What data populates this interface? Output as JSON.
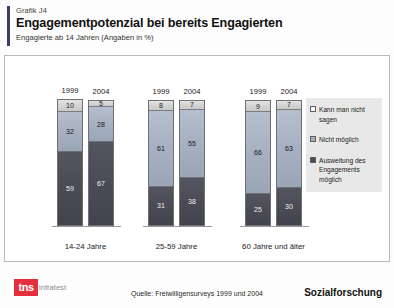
{
  "header": {
    "kicker": "Grafik J4",
    "title": "Engagementpotenzial bei bereits Engagierten",
    "subtitle": "Engagierte ab 14 Jahren (Angaben in %)"
  },
  "legend": {
    "items": [
      {
        "label": "Kann man nicht sagen",
        "swatch": "legend-swatch-white"
      },
      {
        "label": "Nicht möglich",
        "swatch": "legend-swatch-blue-gray"
      },
      {
        "label": "Ausweitung des Engagements möglich",
        "swatch": "legend-swatch-dark"
      }
    ]
  },
  "footer": {
    "logo_mark": "tns",
    "logo_word": "infratest",
    "source": "Quelle: Freiwilligensurveys 1999 und 2004",
    "tagline": "Sozialforschung"
  },
  "chart_data": {
    "type": "bar",
    "title": "Engagementpotenzial bei bereits Engagierten",
    "subtitle": "Engagierte ab 14 Jahren (Angaben in %)",
    "xlabel": "",
    "ylabel": "",
    "ylim": [
      0,
      100
    ],
    "grid": false,
    "stacked": true,
    "legend_position": "right",
    "categories": [
      "14-24 Jahre",
      "25-59 Jahre",
      "60 Jahre und älter"
    ],
    "subcategories": [
      "1999",
      "2004"
    ],
    "series": [
      {
        "name": "Kann man nicht sagen",
        "color": "#d2d2d2",
        "values": [
          [
            10,
            5
          ],
          [
            8,
            7
          ],
          [
            9,
            7
          ]
        ]
      },
      {
        "name": "Nicht möglich",
        "color": "#a6b0c0",
        "values": [
          [
            32,
            28
          ],
          [
            61,
            55
          ],
          [
            66,
            63
          ]
        ]
      },
      {
        "name": "Ausweitung des Engagements möglich",
        "color": "#4b4b55",
        "values": [
          [
            59,
            67
          ],
          [
            31,
            38
          ],
          [
            25,
            30
          ]
        ]
      }
    ],
    "groups": [
      {
        "label": "14-24 Jahre",
        "bars": [
          {
            "year": "1999",
            "top": 10,
            "mid": 32,
            "bot": 59
          },
          {
            "year": "2004",
            "top": 5,
            "mid": 28,
            "bot": 67
          }
        ]
      },
      {
        "label": "25-59 Jahre",
        "bars": [
          {
            "year": "1999",
            "top": 8,
            "mid": 61,
            "bot": 31
          },
          {
            "year": "2004",
            "top": 7,
            "mid": 55,
            "bot": 38
          }
        ]
      },
      {
        "label": "60 Jahre und älter",
        "bars": [
          {
            "year": "1999",
            "top": 9,
            "mid": 66,
            "bot": 25
          },
          {
            "year": "2004",
            "top": 7,
            "mid": 63,
            "bot": 30
          }
        ]
      }
    ]
  }
}
